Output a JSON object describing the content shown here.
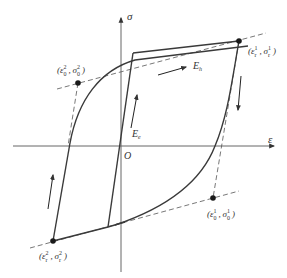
{
  "figure": {
    "type": "hysteresis-loop-stress-strain",
    "axes": {
      "x_label": "ε",
      "y_label": "σ",
      "origin_label": "O"
    },
    "points": [
      {
        "id": "upper-right",
        "symbol": "ε",
        "symbol2": "σ",
        "sub": "r",
        "sup": "1",
        "label": "(ε_r^1, σ_r^1)"
      },
      {
        "id": "upper-left",
        "symbol": "ε",
        "symbol2": "σ",
        "sub": "0",
        "sup": "2",
        "label": "(ε_0^2, σ_0^2)"
      },
      {
        "id": "lower-right",
        "symbol": "ε",
        "symbol2": "σ",
        "sub": "0",
        "sup": "1",
        "label": "(ε_0^1, σ_0^1)"
      },
      {
        "id": "lower-left",
        "symbol": "ε",
        "symbol2": "σ",
        "sub": "r",
        "sup": "2",
        "label": "(ε_r^2, σ_r^2)"
      }
    ],
    "moduli": {
      "elastic": {
        "base": "E",
        "sub": "e"
      },
      "hardening": {
        "base": "E",
        "sub": "h"
      }
    },
    "colors": {
      "curve": "#3a3a3a",
      "axis": "#555555",
      "dashed": "#555555",
      "point": "#1a1a1a"
    }
  }
}
